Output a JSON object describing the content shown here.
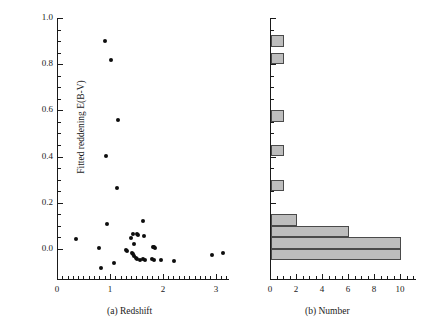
{
  "figure": {
    "background": "#ffffff",
    "marker_color": "#0d0d0d",
    "bar_fill": "#bdbdbd",
    "bar_edge": "#4a4a4a",
    "axis_color": "#1a1a1a"
  },
  "panel_a": {
    "caption": "(a) Redshift",
    "ylabel": "Fitted reddening E(B-V)",
    "x_ticklabels": [
      "0",
      "1",
      "2",
      "3"
    ],
    "y_ticklabels": [
      "0.0",
      "0.2",
      "0.4",
      "0.6",
      "0.8",
      "1.0"
    ]
  },
  "panel_b": {
    "caption": "(b) Number",
    "x_ticklabels": [
      "0",
      "2",
      "4",
      "6",
      "8",
      "10"
    ]
  },
  "chart_data": [
    {
      "type": "scatter",
      "title": "",
      "xlabel": "(a) Redshift",
      "ylabel": "Fitted reddening E(B-V)",
      "xlim": [
        0,
        3.25
      ],
      "ylim": [
        -0.135,
        1.0
      ],
      "xticks": [
        0,
        1,
        2,
        3
      ],
      "yticks": [
        0.0,
        0.2,
        0.4,
        0.6,
        0.8,
        1.0
      ],
      "x_minor_tick_step": 0.1,
      "y_minor_tick_step": 0.05,
      "grid": false,
      "legend": false,
      "marker": "filled-circle",
      "points": [
        {
          "x": 0.9,
          "y": 0.9
        },
        {
          "x": 1.02,
          "y": 0.82
        },
        {
          "x": 1.16,
          "y": 0.557
        },
        {
          "x": 0.93,
          "y": 0.403
        },
        {
          "x": 1.14,
          "y": 0.262
        },
        {
          "x": 1.63,
          "y": 0.122
        },
        {
          "x": 0.94,
          "y": 0.106
        },
        {
          "x": 1.44,
          "y": 0.063
        },
        {
          "x": 1.51,
          "y": 0.066
        },
        {
          "x": 1.53,
          "y": 0.06
        },
        {
          "x": 1.65,
          "y": 0.055
        },
        {
          "x": 1.4,
          "y": 0.048
        },
        {
          "x": 0.35,
          "y": 0.042
        },
        {
          "x": 1.46,
          "y": 0.023
        },
        {
          "x": 0.8,
          "y": 0.005
        },
        {
          "x": 1.81,
          "y": 0.008
        },
        {
          "x": 1.84,
          "y": 0.006
        },
        {
          "x": 1.86,
          "y": 0.002
        },
        {
          "x": 1.3,
          "y": -0.006
        },
        {
          "x": 1.33,
          "y": -0.01
        },
        {
          "x": 1.42,
          "y": -0.016
        },
        {
          "x": 1.44,
          "y": -0.024
        },
        {
          "x": 1.46,
          "y": -0.033
        },
        {
          "x": 1.49,
          "y": -0.04
        },
        {
          "x": 1.52,
          "y": -0.046
        },
        {
          "x": 1.57,
          "y": -0.05
        },
        {
          "x": 1.63,
          "y": -0.046
        },
        {
          "x": 1.66,
          "y": -0.05
        },
        {
          "x": 1.79,
          "y": -0.046
        },
        {
          "x": 1.83,
          "y": -0.05
        },
        {
          "x": 1.96,
          "y": -0.048
        },
        {
          "x": 2.22,
          "y": -0.052
        },
        {
          "x": 2.93,
          "y": -0.025
        },
        {
          "x": 3.14,
          "y": -0.018
        },
        {
          "x": 1.07,
          "y": -0.062
        },
        {
          "x": 0.84,
          "y": -0.085
        }
      ]
    },
    {
      "type": "bar",
      "orientation": "horizontal",
      "title": "",
      "xlabel": "(b) Number",
      "ylabel": "",
      "xlim": [
        0,
        11.2
      ],
      "ylim": [
        -0.135,
        1.0
      ],
      "xticks": [
        0,
        2,
        4,
        6,
        8,
        10
      ],
      "x_minor_tick_step": 0.5,
      "y_minor_tick_step": 0.05,
      "grid": false,
      "legend": false,
      "bin_width": 0.05,
      "bins_lower_edge": [
        0.875,
        0.8,
        0.55,
        0.4,
        0.25,
        0.1,
        0.05,
        0.0,
        -0.05
      ],
      "values": [
        1,
        1,
        1,
        1,
        1,
        2,
        6,
        10,
        10
      ]
    }
  ]
}
